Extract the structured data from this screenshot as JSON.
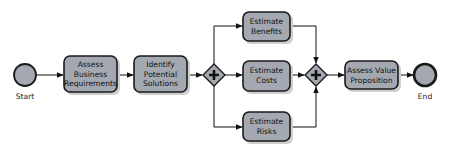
{
  "diagram": {
    "type": "bpmn-process",
    "events": {
      "start": {
        "label": "Start"
      },
      "end": {
        "label": "End"
      }
    },
    "tasks": {
      "assess_business": {
        "lines": [
          "Assess",
          "Business",
          "Requirements"
        ]
      },
      "identify_solutions": {
        "lines": [
          "Identify",
          "Potential",
          "Solutions"
        ]
      },
      "estimate_benefits": {
        "lines": [
          "Estimate",
          "Benefits"
        ]
      },
      "estimate_costs": {
        "lines": [
          "Estimate",
          "Costs"
        ]
      },
      "estimate_risks": {
        "lines": [
          "Estimate",
          "Risks"
        ]
      },
      "assess_value": {
        "lines": [
          "Assess Value",
          "Proposition"
        ]
      }
    },
    "gateways": {
      "split": {
        "kind": "parallel",
        "symbol": "plus"
      },
      "join": {
        "kind": "parallel",
        "symbol": "plus"
      }
    },
    "flows": [
      [
        "start",
        "assess_business"
      ],
      [
        "assess_business",
        "identify_solutions"
      ],
      [
        "identify_solutions",
        "split"
      ],
      [
        "split",
        "estimate_benefits"
      ],
      [
        "split",
        "estimate_costs"
      ],
      [
        "split",
        "estimate_risks"
      ],
      [
        "estimate_benefits",
        "join"
      ],
      [
        "estimate_costs",
        "join"
      ],
      [
        "estimate_risks",
        "join"
      ],
      [
        "join",
        "assess_value"
      ],
      [
        "assess_value",
        "end"
      ]
    ]
  }
}
